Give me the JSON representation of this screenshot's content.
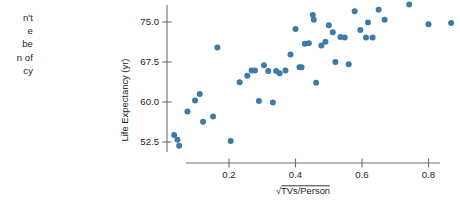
{
  "body_text": {
    "lines": [
      "n't",
      "e",
      "be",
      "n of",
      "cy"
    ]
  },
  "chart_data": {
    "type": "scatter",
    "title": "",
    "xlabel": "√TVs/Person",
    "ylabel": "Life Expectancy (yr)",
    "xticks": [
      0.2,
      0.4,
      0.6,
      0.8
    ],
    "xtick_labels": [
      "0.2",
      "0.4",
      "0.6",
      "0.8"
    ],
    "yticks": [
      52.5,
      60.0,
      67.5,
      75.0
    ],
    "ytick_labels": [
      "52.5",
      "60.0",
      "67.5",
      "75.0"
    ],
    "xlim": [
      0.0,
      0.95
    ],
    "ylim": [
      49.5,
      79.0
    ],
    "grid": false,
    "legend": null,
    "marker_color": "#3b7ba6",
    "axis_color": "#6d6e71",
    "points": [
      {
        "x": 0.035,
        "y": 53.8
      },
      {
        "x": 0.045,
        "y": 52.9
      },
      {
        "x": 0.05,
        "y": 51.8
      },
      {
        "x": 0.075,
        "y": 58.2
      },
      {
        "x": 0.098,
        "y": 60.3
      },
      {
        "x": 0.112,
        "y": 61.5
      },
      {
        "x": 0.122,
        "y": 56.3
      },
      {
        "x": 0.152,
        "y": 57.3
      },
      {
        "x": 0.165,
        "y": 70.2
      },
      {
        "x": 0.205,
        "y": 52.7
      },
      {
        "x": 0.232,
        "y": 63.7
      },
      {
        "x": 0.255,
        "y": 64.9
      },
      {
        "x": 0.268,
        "y": 65.9
      },
      {
        "x": 0.278,
        "y": 65.9
      },
      {
        "x": 0.29,
        "y": 60.2
      },
      {
        "x": 0.305,
        "y": 66.9
      },
      {
        "x": 0.318,
        "y": 65.8
      },
      {
        "x": 0.332,
        "y": 59.9
      },
      {
        "x": 0.342,
        "y": 65.8
      },
      {
        "x": 0.352,
        "y": 65.4
      },
      {
        "x": 0.37,
        "y": 65.9
      },
      {
        "x": 0.385,
        "y": 68.9
      },
      {
        "x": 0.4,
        "y": 73.7
      },
      {
        "x": 0.412,
        "y": 66.5
      },
      {
        "x": 0.418,
        "y": 66.5
      },
      {
        "x": 0.428,
        "y": 70.9
      },
      {
        "x": 0.44,
        "y": 71.0
      },
      {
        "x": 0.452,
        "y": 76.3
      },
      {
        "x": 0.455,
        "y": 75.4
      },
      {
        "x": 0.462,
        "y": 63.6
      },
      {
        "x": 0.478,
        "y": 70.6
      },
      {
        "x": 0.49,
        "y": 71.3
      },
      {
        "x": 0.5,
        "y": 74.4
      },
      {
        "x": 0.512,
        "y": 73.1
      },
      {
        "x": 0.52,
        "y": 67.5
      },
      {
        "x": 0.535,
        "y": 72.2
      },
      {
        "x": 0.548,
        "y": 72.1
      },
      {
        "x": 0.56,
        "y": 67.1
      },
      {
        "x": 0.578,
        "y": 77.0
      },
      {
        "x": 0.595,
        "y": 73.5
      },
      {
        "x": 0.612,
        "y": 72.1
      },
      {
        "x": 0.618,
        "y": 74.9
      },
      {
        "x": 0.632,
        "y": 72.1
      },
      {
        "x": 0.65,
        "y": 77.3
      },
      {
        "x": 0.668,
        "y": 75.4
      },
      {
        "x": 0.742,
        "y": 78.3
      },
      {
        "x": 0.8,
        "y": 74.6
      },
      {
        "x": 0.868,
        "y": 74.8
      }
    ]
  }
}
